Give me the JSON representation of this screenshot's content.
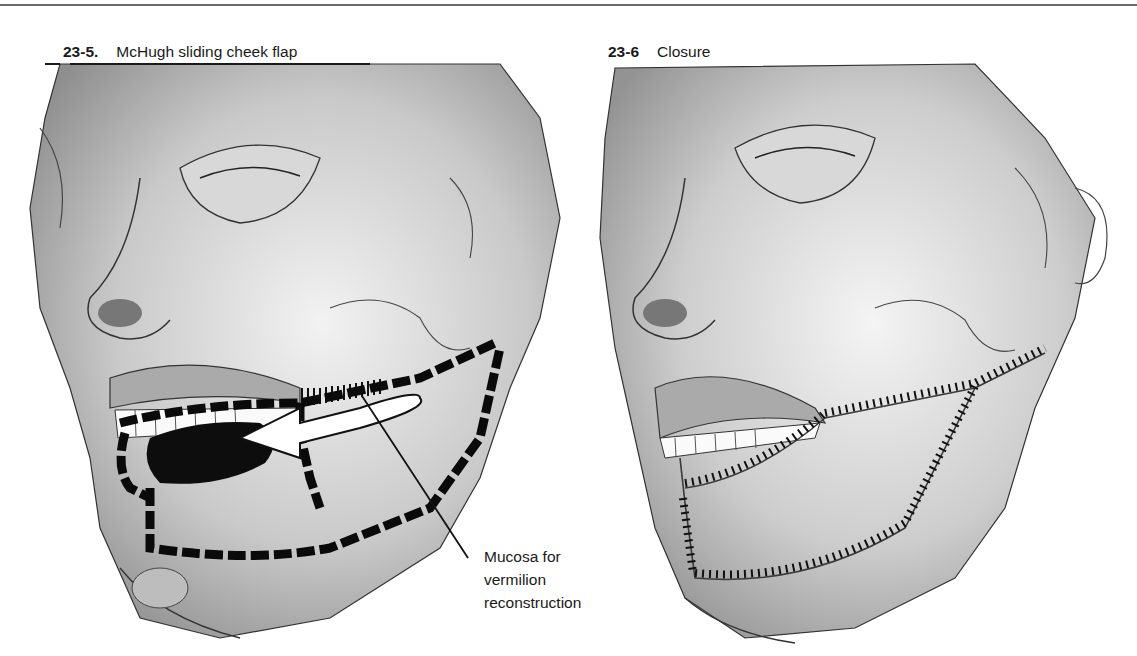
{
  "figures": [
    {
      "number": "23-5.",
      "title": "McHugh sliding cheek flap",
      "illustration": "face-three-quarter-view-with-dashed-flap-incisions-and-arrow",
      "annotation": {
        "lines": [
          "Mucosa for",
          "vermilion",
          "reconstruction"
        ]
      }
    },
    {
      "number": "23-6",
      "title": "Closure",
      "illustration": "face-three-quarter-view-with-sutured-incision-lines"
    }
  ],
  "colors": {
    "ink": "#1a1a1a",
    "rule": "#6b6b6b",
    "shade": "#9a9a9a",
    "paper": "#ffffff"
  }
}
